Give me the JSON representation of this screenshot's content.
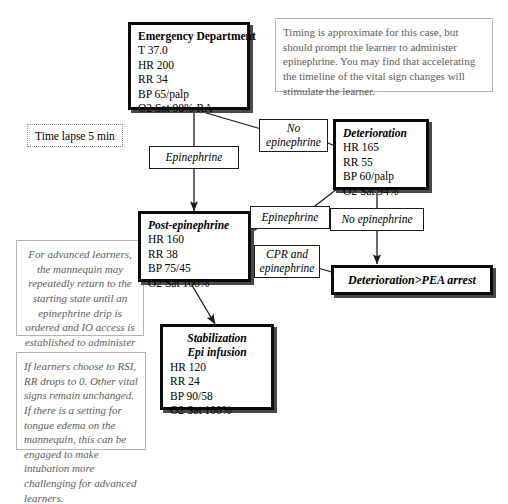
{
  "diagram": {
    "states": {
      "emergency_department": {
        "title": "Emergency Department",
        "vitals": [
          "T 37.0",
          "HR 200",
          "RR 34",
          "BP 65/palp",
          "O2 Sat 98% RA"
        ]
      },
      "deterioration": {
        "title": "Deterioration",
        "vitals": [
          "HR 165",
          "RR 55",
          "BP 60/palp",
          "O2 Sat 94%"
        ]
      },
      "post_epinephrine": {
        "title": "Post-epinephrine",
        "vitals": [
          "HR 160",
          "RR 38",
          "BP 75/45",
          "O2 Sat 100%"
        ]
      },
      "stabilization": {
        "title_line1": "Stabilization",
        "title_line2": "Epi infusion",
        "vitals": [
          "HR 120",
          "RR 24",
          "BP 90/58",
          "O2 Sat 100%"
        ]
      },
      "pea_arrest": {
        "title": "Deterioration>PEA arrest"
      }
    },
    "edge_labels": {
      "epinephrine_from_ed": "Epinephrine",
      "no_epinephrine_from_ed_line1": "No",
      "no_epinephrine_from_ed_line2": "epinephrine",
      "epinephrine_from_deterioration": "Epinephrine",
      "no_epinephrine_from_deterioration": "No epinephrine",
      "cpr_and_epinephrine_line1": "CPR and",
      "cpr_and_epinephrine_line2": "epinephrine"
    },
    "time_lapse": "Time lapse 5 min",
    "notes": {
      "timing": "Timing is approximate for this case, but should prompt the learner to administer epinephrine. You may find that accelerating the timeline of the vital sign changes will stimulate the learner.",
      "advanced_learners": "For advanced learners, the mannequin may repeatedly return to the starting state until an epinephrine drip is ordered and IO access is established to administer it.",
      "rsi": "If learners choose to RSI, RR drops to 0. Other vital signs remain unchanged. If there is a setting for tongue edema on the mannequin, this can be engaged to make intubation more challenging for advanced learners."
    },
    "colors": {
      "state_border": "#0a0a0a",
      "note_border": "#b4b4b4",
      "note_text": "#5c5c5c",
      "arrow": "#1a1a1a",
      "background": "#ffffff"
    }
  }
}
